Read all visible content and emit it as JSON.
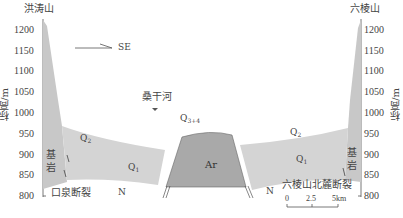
{
  "diagram": {
    "type": "geological-cross-section",
    "left_mountain": "洪涛山",
    "right_mountain": "六棱山",
    "direction_label": "SE",
    "river_label": "桑干河",
    "y_axis_label": "标高/m",
    "y_ticks": [
      "1200",
      "1150",
      "1100",
      "1050",
      "1000",
      "950",
      "900",
      "850",
      "800"
    ],
    "units": {
      "q2_left": {
        "main": "Q",
        "sub": "2"
      },
      "q2_right": {
        "main": "Q",
        "sub": "2"
      },
      "q1_left": {
        "main": "Q",
        "sub": "1"
      },
      "q1_right": {
        "main": "Q",
        "sub": "1"
      },
      "q34": {
        "main": "Q",
        "sub": "3+4"
      },
      "ar": "Ar",
      "bedrock_left_1": "基",
      "bedrock_left_2": "岩",
      "bedrock_right_1": "基",
      "bedrock_right_2": "岩",
      "n_left": "N",
      "n_right": "N"
    },
    "faults": {
      "left": "口泉断裂",
      "right": "六棱山北麓断裂"
    },
    "scale": {
      "ticks": [
        "0",
        "2.5",
        "5km"
      ]
    },
    "colors": {
      "quaternary_fill": "#d4d4d4",
      "ar_fill": "#a9a9a9",
      "bedrock_fill": "#c8c8c8",
      "line": "#555555"
    }
  }
}
